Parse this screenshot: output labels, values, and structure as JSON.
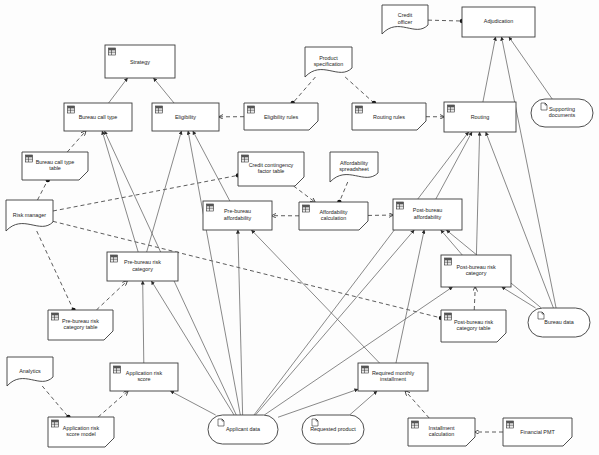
{
  "diagram": {
    "type": "decision-requirements-diagram",
    "canvas": {
      "width": 599,
      "height": 455
    },
    "colors": {
      "background": "#fdfdfd",
      "node_fill": "#ffffff",
      "node_stroke": "#3a3a3a",
      "edge_solid": "#6b6b6b",
      "edge_dashed": "#4a4a4a",
      "text": "#1c1c1c"
    },
    "shape_legend": {
      "decision": "rectangle with table icon",
      "business_knowledge_model": "rectangle with clipped bottom-right corner and table icon",
      "input_data": "stadium / rounded rectangle with page icon",
      "knowledge_source": "document shape with wavy bottom edge"
    },
    "nodes": [
      {
        "id": "strategy",
        "label": "Strategy",
        "shape": "decision",
        "x": 105,
        "y": 45,
        "w": 70,
        "h": 33,
        "icon": "table-icon"
      },
      {
        "id": "bureau-call-type",
        "label": "Bureau call type",
        "shape": "decision",
        "x": 64,
        "y": 103,
        "w": 68,
        "h": 28,
        "icon": "table-icon"
      },
      {
        "id": "eligibility",
        "label": "Eligibility",
        "shape": "decision",
        "x": 152,
        "y": 103,
        "w": 67,
        "h": 28,
        "icon": "table-icon"
      },
      {
        "id": "eligibility-rules",
        "label": "Eligibility rules",
        "shape": "business_knowledge_model",
        "x": 244,
        "y": 103,
        "w": 74,
        "h": 27,
        "icon": "table-icon"
      },
      {
        "id": "routing-rules",
        "label": "Routing rules",
        "shape": "business_knowledge_model",
        "x": 352,
        "y": 103,
        "w": 74,
        "h": 27,
        "icon": "table-icon"
      },
      {
        "id": "routing",
        "label": "Routing",
        "shape": "decision",
        "x": 444,
        "y": 102,
        "w": 72,
        "h": 30,
        "icon": "table-icon"
      },
      {
        "id": "adjudication",
        "label": "Adjudication",
        "shape": "decision",
        "x": 462,
        "y": 7,
        "w": 73,
        "h": 30,
        "icon": "none"
      },
      {
        "id": "credit-officer",
        "label": "Credit officer",
        "shape": "knowledge_source",
        "x": 382,
        "y": 5,
        "w": 46,
        "h": 29,
        "icon": "none"
      },
      {
        "id": "product-specification",
        "label": "Product specification",
        "shape": "knowledge_source",
        "x": 305,
        "y": 47,
        "w": 47,
        "h": 30,
        "icon": "none"
      },
      {
        "id": "supporting-documents",
        "label": "Supporting documents",
        "shape": "input_data",
        "x": 531,
        "y": 99,
        "w": 62,
        "h": 28,
        "icon": "page-icon"
      },
      {
        "id": "bureau-call-type-table",
        "label": "Bureau call type table",
        "shape": "business_knowledge_model",
        "x": 22,
        "y": 152,
        "w": 66,
        "h": 28,
        "icon": "table-icon"
      },
      {
        "id": "credit-contingency-factor-table",
        "label": "Credit contingency factor table",
        "shape": "business_knowledge_model",
        "x": 238,
        "y": 152,
        "w": 66,
        "h": 34,
        "icon": "table-icon"
      },
      {
        "id": "affordability-spreadsheet",
        "label": "Affordability spreadsheet",
        "shape": "knowledge_source",
        "x": 330,
        "y": 152,
        "w": 48,
        "h": 30,
        "icon": "none"
      },
      {
        "id": "risk-manager",
        "label": "Risk manager",
        "shape": "knowledge_source",
        "x": 6,
        "y": 200,
        "w": 47,
        "h": 31,
        "icon": "none"
      },
      {
        "id": "pre-bureau-affordability",
        "label": "Pre-bureau affordability",
        "shape": "decision",
        "x": 203,
        "y": 201,
        "w": 69,
        "h": 29,
        "icon": "table-icon"
      },
      {
        "id": "affordability-calculation",
        "label": "Affordability calculation",
        "shape": "business_knowledge_model",
        "x": 299,
        "y": 202,
        "w": 69,
        "h": 28,
        "icon": "table-icon"
      },
      {
        "id": "post-bureau-affordability",
        "label": "Post-bureau affordability",
        "shape": "decision",
        "x": 393,
        "y": 199,
        "w": 69,
        "h": 31,
        "icon": "table-icon"
      },
      {
        "id": "pre-bureau-risk-category",
        "label": "Pre-bureau risk category",
        "shape": "decision",
        "x": 107,
        "y": 252,
        "w": 71,
        "h": 29,
        "icon": "table-icon"
      },
      {
        "id": "post-bureau-risk-category",
        "label": "Post-bureau risk category",
        "shape": "decision",
        "x": 441,
        "y": 255,
        "w": 70,
        "h": 32,
        "icon": "table-icon"
      },
      {
        "id": "pre-bureau-risk-category-table",
        "label": "Pre-bureau risk category table",
        "shape": "business_knowledge_model",
        "x": 48,
        "y": 310,
        "w": 65,
        "h": 30,
        "icon": "table-icon"
      },
      {
        "id": "post-bureau-risk-category-table",
        "label": "Post-bureau risk category table",
        "shape": "business_knowledge_model",
        "x": 441,
        "y": 310,
        "w": 65,
        "h": 32,
        "icon": "table-icon"
      },
      {
        "id": "bureau-data",
        "label": "Bureau data",
        "shape": "input_data",
        "x": 528,
        "y": 308,
        "w": 62,
        "h": 29,
        "icon": "page-icon"
      },
      {
        "id": "analytics",
        "label": "Analytics",
        "shape": "knowledge_source",
        "x": 7,
        "y": 357,
        "w": 46,
        "h": 29,
        "icon": "none"
      },
      {
        "id": "application-risk-score",
        "label": "Application risk score",
        "shape": "decision",
        "x": 110,
        "y": 363,
        "w": 68,
        "h": 28,
        "icon": "table-icon"
      },
      {
        "id": "required-monthly-installment",
        "label": "Required monthly installment",
        "shape": "decision",
        "x": 358,
        "y": 363,
        "w": 70,
        "h": 28,
        "icon": "table-icon"
      },
      {
        "id": "application-risk-score-model",
        "label": "Application risk score model",
        "shape": "business_knowledge_model",
        "x": 48,
        "y": 417,
        "w": 66,
        "h": 30,
        "icon": "table-icon"
      },
      {
        "id": "applicant-data",
        "label": "Applicant data",
        "shape": "input_data",
        "x": 208,
        "y": 415,
        "w": 70,
        "h": 29,
        "icon": "page-icon"
      },
      {
        "id": "requested-product",
        "label": "Requested product",
        "shape": "input_data",
        "x": 302,
        "y": 415,
        "w": 62,
        "h": 29,
        "icon": "page-icon"
      },
      {
        "id": "installment-calculation",
        "label": "Installment calculation",
        "shape": "business_knowledge_model",
        "x": 408,
        "y": 418,
        "w": 67,
        "h": 28,
        "icon": "table-icon"
      },
      {
        "id": "financial-pmt",
        "label": "Financial PMT",
        "shape": "business_knowledge_model",
        "x": 503,
        "y": 418,
        "w": 69,
        "h": 28,
        "icon": "table-icon"
      }
    ],
    "edges": [
      {
        "from": "bureau-call-type",
        "to": "strategy",
        "style": "solid",
        "arrow": "filled"
      },
      {
        "from": "eligibility",
        "to": "strategy",
        "style": "solid",
        "arrow": "filled"
      },
      {
        "from": "eligibility-rules",
        "to": "eligibility",
        "style": "dashed",
        "arrow": "open"
      },
      {
        "from": "product-specification",
        "to": "eligibility-rules",
        "style": "dashed",
        "arrow": "ball"
      },
      {
        "from": "product-specification",
        "to": "routing-rules",
        "style": "dashed",
        "arrow": "ball"
      },
      {
        "from": "routing-rules",
        "to": "routing",
        "style": "dashed",
        "arrow": "open"
      },
      {
        "from": "credit-officer",
        "to": "adjudication",
        "style": "dashed",
        "arrow": "ball"
      },
      {
        "from": "routing",
        "to": "adjudication",
        "style": "solid",
        "arrow": "filled"
      },
      {
        "from": "supporting-documents",
        "to": "adjudication",
        "style": "solid",
        "arrow": "filled"
      },
      {
        "from": "bureau-call-type-table",
        "to": "bureau-call-type",
        "style": "dashed",
        "arrow": "open"
      },
      {
        "from": "risk-manager",
        "to": "bureau-call-type-table",
        "style": "dashed",
        "arrow": "ball"
      },
      {
        "from": "risk-manager",
        "to": "credit-contingency-factor-table",
        "style": "dashed",
        "arrow": "ball"
      },
      {
        "from": "risk-manager",
        "to": "pre-bureau-risk-category-table",
        "style": "dashed",
        "arrow": "ball"
      },
      {
        "from": "risk-manager",
        "to": "post-bureau-risk-category-table",
        "style": "dashed",
        "arrow": "ball"
      },
      {
        "from": "credit-contingency-factor-table",
        "to": "affordability-calculation",
        "style": "dashed",
        "arrow": "open"
      },
      {
        "from": "affordability-spreadsheet",
        "to": "affordability-calculation",
        "style": "dashed",
        "arrow": "ball"
      },
      {
        "from": "affordability-calculation",
        "to": "pre-bureau-affordability",
        "style": "dashed",
        "arrow": "open"
      },
      {
        "from": "affordability-calculation",
        "to": "post-bureau-affordability",
        "style": "dashed",
        "arrow": "open"
      },
      {
        "from": "pre-bureau-affordability",
        "to": "eligibility",
        "style": "solid",
        "arrow": "filled"
      },
      {
        "from": "pre-bureau-risk-category",
        "to": "eligibility",
        "style": "solid",
        "arrow": "filled"
      },
      {
        "from": "pre-bureau-risk-category",
        "to": "bureau-call-type",
        "style": "solid",
        "arrow": "filled"
      },
      {
        "from": "pre-bureau-risk-category-table",
        "to": "pre-bureau-risk-category",
        "style": "dashed",
        "arrow": "open"
      },
      {
        "from": "application-risk-score",
        "to": "pre-bureau-risk-category",
        "style": "solid",
        "arrow": "filled"
      },
      {
        "from": "application-risk-score-model",
        "to": "application-risk-score",
        "style": "dashed",
        "arrow": "open"
      },
      {
        "from": "analytics",
        "to": "application-risk-score-model",
        "style": "dashed",
        "arrow": "ball"
      },
      {
        "from": "applicant-data",
        "to": "application-risk-score",
        "style": "solid",
        "arrow": "filled"
      },
      {
        "from": "applicant-data",
        "to": "pre-bureau-risk-category",
        "style": "solid",
        "arrow": "filled"
      },
      {
        "from": "applicant-data",
        "to": "pre-bureau-affordability",
        "style": "solid",
        "arrow": "filled"
      },
      {
        "from": "applicant-data",
        "to": "post-bureau-affordability",
        "style": "solid",
        "arrow": "filled"
      },
      {
        "from": "applicant-data",
        "to": "post-bureau-risk-category",
        "style": "solid",
        "arrow": "filled"
      },
      {
        "from": "applicant-data",
        "to": "eligibility",
        "style": "solid",
        "arrow": "filled"
      },
      {
        "from": "applicant-data",
        "to": "bureau-call-type",
        "style": "solid",
        "arrow": "filled"
      },
      {
        "from": "applicant-data",
        "to": "required-monthly-installment",
        "style": "solid",
        "arrow": "filled"
      },
      {
        "from": "applicant-data",
        "to": "routing",
        "style": "solid",
        "arrow": "filled"
      },
      {
        "from": "requested-product",
        "to": "required-monthly-installment",
        "style": "solid",
        "arrow": "filled"
      },
      {
        "from": "installment-calculation",
        "to": "required-monthly-installment",
        "style": "dashed",
        "arrow": "open"
      },
      {
        "from": "financial-pmt",
        "to": "installment-calculation",
        "style": "dashed",
        "arrow": "open"
      },
      {
        "from": "required-monthly-installment",
        "to": "pre-bureau-affordability",
        "style": "solid",
        "arrow": "filled"
      },
      {
        "from": "required-monthly-installment",
        "to": "post-bureau-affordability",
        "style": "solid",
        "arrow": "filled"
      },
      {
        "from": "post-bureau-affordability",
        "to": "routing",
        "style": "solid",
        "arrow": "filled"
      },
      {
        "from": "post-bureau-risk-category",
        "to": "routing",
        "style": "solid",
        "arrow": "filled"
      },
      {
        "from": "post-bureau-risk-category",
        "to": "post-bureau-affordability",
        "style": "solid",
        "arrow": "filled"
      },
      {
        "from": "post-bureau-risk-category-table",
        "to": "post-bureau-risk-category",
        "style": "dashed",
        "arrow": "open"
      },
      {
        "from": "bureau-data",
        "to": "post-bureau-risk-category",
        "style": "solid",
        "arrow": "filled"
      },
      {
        "from": "bureau-data",
        "to": "post-bureau-affordability",
        "style": "solid",
        "arrow": "filled"
      },
      {
        "from": "bureau-data",
        "to": "adjudication",
        "style": "solid",
        "arrow": "filled"
      },
      {
        "from": "bureau-data",
        "to": "routing",
        "style": "solid",
        "arrow": "filled"
      }
    ]
  }
}
